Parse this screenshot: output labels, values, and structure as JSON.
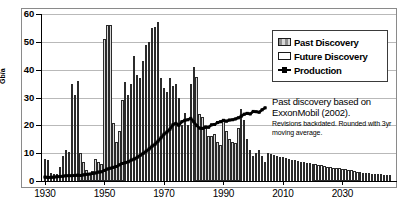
{
  "chart_data": {
    "type": "bar",
    "title": "",
    "xlabel": "",
    "ylabel": "Gb/a",
    "xlim": [
      1929,
      2048
    ],
    "ylim": [
      0,
      60
    ],
    "grid": true,
    "legend_position": "top-right",
    "y_ticks": [
      0,
      10,
      20,
      30,
      40,
      50,
      60
    ],
    "x_ticks": [
      1930,
      1950,
      1970,
      1990,
      2010,
      2030
    ],
    "annotation_main": "Past discovery based on ExxonMobil (2002).",
    "annotation_sub": "Revisions backdated. Rounded with 3yr moving average.",
    "series": [
      {
        "name": "Past Discovery",
        "type": "bar",
        "x": [
          1930,
          1931,
          1932,
          1933,
          1934,
          1935,
          1936,
          1937,
          1938,
          1939,
          1940,
          1941,
          1942,
          1943,
          1944,
          1945,
          1946,
          1947,
          1948,
          1949,
          1950,
          1951,
          1952,
          1953,
          1954,
          1955,
          1956,
          1957,
          1958,
          1959,
          1960,
          1961,
          1962,
          1963,
          1964,
          1965,
          1966,
          1967,
          1968,
          1969,
          1970,
          1971,
          1972,
          1973,
          1974,
          1975,
          1976,
          1977,
          1978,
          1979,
          1980,
          1981,
          1982,
          1983,
          1984,
          1985,
          1986,
          1987,
          1988,
          1989,
          1990,
          1991,
          1992,
          1993,
          1994,
          1995,
          1996,
          1997,
          1998,
          1999,
          2000,
          2001,
          2002,
          2003,
          2004
        ],
        "values": [
          8,
          7.5,
          3,
          2.5,
          2.5,
          5,
          9,
          11,
          10.5,
          35,
          31,
          36,
          10,
          7,
          4,
          3,
          3.5,
          8,
          7,
          6,
          51,
          56,
          56,
          21,
          14,
          18,
          29,
          35.5,
          31,
          35,
          45,
          38,
          37,
          43,
          49,
          50,
          55,
          55.5,
          57,
          37,
          33.5,
          32,
          37,
          34,
          35,
          30,
          20,
          24.5,
          20,
          35,
          41,
          37.5,
          24,
          23,
          19,
          16,
          16,
          17,
          14,
          13,
          22,
          18,
          15,
          14,
          13.5,
          19,
          26,
          22,
          15,
          11,
          9,
          10,
          11,
          9,
          7
        ]
      },
      {
        "name": "Future Discovery",
        "type": "bar",
        "x": [
          2005,
          2006,
          2007,
          2008,
          2009,
          2010,
          2011,
          2012,
          2013,
          2014,
          2015,
          2016,
          2017,
          2018,
          2019,
          2020,
          2021,
          2022,
          2023,
          2024,
          2025,
          2026,
          2027,
          2028,
          2029,
          2030,
          2031,
          2032,
          2033,
          2034,
          2035,
          2036,
          2037,
          2038,
          2039,
          2040,
          2041,
          2042,
          2043,
          2044,
          2045,
          2046
        ],
        "values": [
          10,
          9.7,
          9.4,
          9.1,
          8.8,
          8.5,
          8.2,
          7.9,
          7.6,
          7.4,
          7.2,
          7.0,
          6.8,
          6.6,
          6.4,
          6.2,
          6.0,
          5.8,
          5.6,
          5.4,
          5.2,
          5.0,
          4.8,
          4.6,
          4.5,
          4.4,
          4.2,
          4.0,
          3.8,
          3.6,
          3.4,
          3.2,
          3.0,
          2.9,
          2.8,
          2.7,
          2.6,
          2.5,
          2.4,
          2.3,
          2.2,
          2.0
        ]
      },
      {
        "name": "Production",
        "type": "line",
        "x": [
          1930,
          1931,
          1932,
          1933,
          1934,
          1935,
          1936,
          1937,
          1938,
          1939,
          1940,
          1941,
          1942,
          1943,
          1944,
          1945,
          1946,
          1947,
          1948,
          1949,
          1950,
          1951,
          1952,
          1953,
          1954,
          1955,
          1956,
          1957,
          1958,
          1959,
          1960,
          1961,
          1962,
          1963,
          1964,
          1965,
          1966,
          1967,
          1968,
          1969,
          1970,
          1971,
          1972,
          1973,
          1974,
          1975,
          1976,
          1977,
          1978,
          1979,
          1980,
          1981,
          1982,
          1983,
          1984,
          1985,
          1986,
          1987,
          1988,
          1989,
          1990,
          1991,
          1992,
          1993,
          1994,
          1995,
          1996,
          1997,
          1998,
          1999,
          2000,
          2001,
          2002,
          2003,
          2004
        ],
        "values": [
          1.4,
          1.3,
          1.3,
          1.4,
          1.5,
          1.6,
          1.7,
          1.9,
          1.9,
          1.9,
          2.0,
          2.1,
          2.0,
          2.2,
          2.4,
          2.5,
          2.7,
          2.9,
          3.2,
          3.3,
          3.8,
          4.3,
          4.6,
          4.9,
          5.2,
          5.8,
          6.3,
          6.6,
          6.9,
          7.5,
          7.9,
          8.5,
          9.2,
          9.9,
          10.7,
          11.5,
          12.5,
          13.2,
          14.3,
          15.5,
          16.8,
          17.6,
          18.6,
          20.2,
          20.7,
          20.0,
          21.3,
          21.8,
          22.0,
          22.5,
          21.3,
          19.9,
          19.0,
          18.9,
          19.4,
          19.3,
          20.2,
          20.3,
          21.0,
          21.3,
          21.8,
          21.5,
          21.9,
          22.0,
          22.3,
          22.7,
          23.3,
          24.0,
          24.3,
          24.1,
          25.0,
          24.9,
          24.7,
          25.6,
          26.3
        ]
      }
    ]
  },
  "legend": {
    "items": [
      {
        "label": "Past Discovery",
        "style": "hatched-swatch"
      },
      {
        "label": "Future Discovery",
        "style": "white-swatch"
      },
      {
        "label": "Production",
        "style": "line-marker"
      }
    ]
  },
  "axes": {
    "y_title": "Gb/a",
    "y_tick_labels": [
      "0",
      "10",
      "20",
      "30",
      "40",
      "50",
      "60"
    ],
    "x_tick_labels": [
      "1930",
      "1950",
      "1970",
      "1990",
      "2010",
      "2030"
    ]
  },
  "annotation": {
    "main": "Past discovery based on ExxonMobil (2002).",
    "sub": "Revisions backdated. Rounded with 3yr moving average."
  },
  "colors": {
    "bar_edge": "#2b2b2b",
    "past_fill": "#b5b5b5",
    "future_fill": "#ffffff",
    "production_line": "#000000",
    "grid": "#b9b9b9",
    "frame": "#8a8a8a"
  }
}
